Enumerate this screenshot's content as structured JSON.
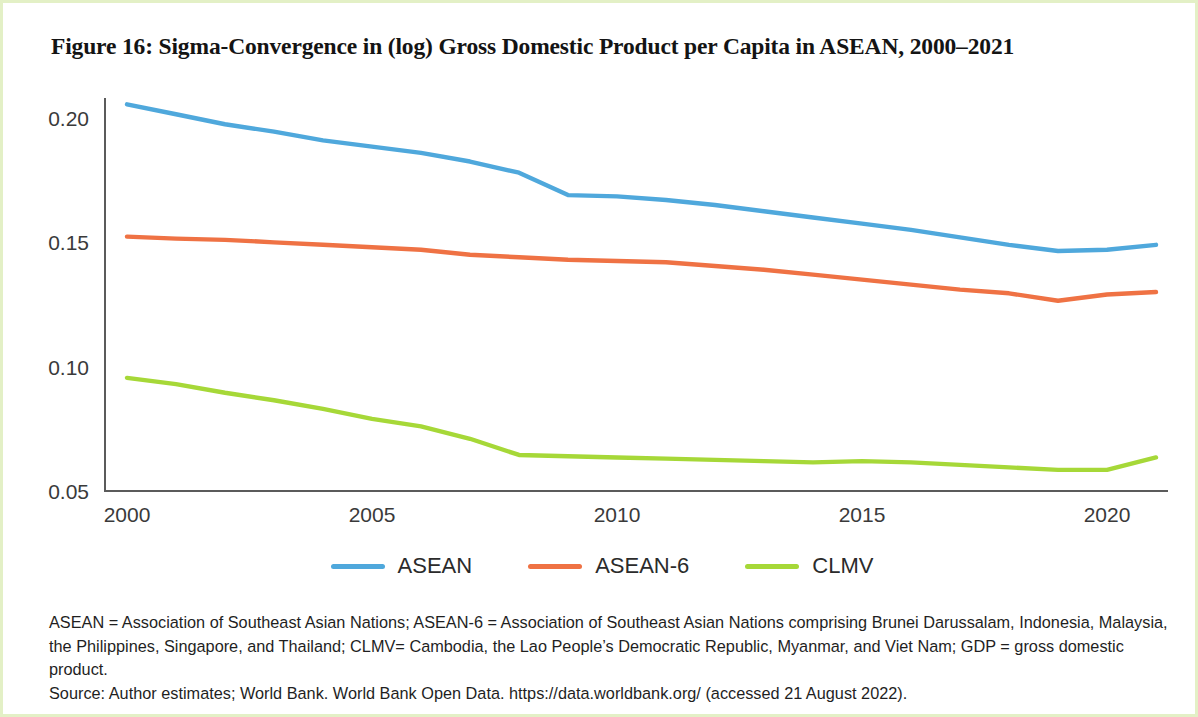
{
  "figure": {
    "title": "Figure 16: Sigma-Convergence in (log) Gross Domestic Product per Capita in ASEAN, 2000–2021",
    "border_color": "#e3f0c6"
  },
  "legend": {
    "position": "bottom-center",
    "items": [
      {
        "label": "ASEAN",
        "color": "#4fa8dc"
      },
      {
        "label": "ASEAN-6",
        "color": "#ef7244"
      },
      {
        "label": "CLMV",
        "color": "#a6d838"
      }
    ]
  },
  "notes": {
    "definitions": "ASEAN = Association of Southeast Asian Nations; ASEAN-6 = Association of Southeast Asian Nations comprising Brunei Darussalam, Indonesia, Malaysia, the Philippines, Singapore, and Thailand; CLMV= Cambodia, the Lao People’s Democratic Republic, Myanmar, and Viet Nam; GDP = gross domestic product.",
    "source": "Source: Author estimates; World Bank. World Bank Open Data. https://data.worldbank.org/ (accessed 21 August 2022)."
  },
  "chart_data": {
    "type": "line",
    "title": "Figure 16: Sigma-Convergence in (log) Gross Domestic Product per Capita in ASEAN, 2000–2021",
    "xlabel": "",
    "ylabel": "",
    "grid": false,
    "legend_position": "bottom-center",
    "xlim": [
      2000,
      2021
    ],
    "ylim": [
      0.05,
      0.215
    ],
    "x": [
      2000,
      2001,
      2002,
      2003,
      2004,
      2005,
      2006,
      2007,
      2008,
      2009,
      2010,
      2011,
      2012,
      2013,
      2014,
      2015,
      2016,
      2017,
      2018,
      2019,
      2020,
      2021
    ],
    "xticks": [
      2000,
      2005,
      2010,
      2015,
      2020
    ],
    "xtick_labels": [
      "2000",
      "2005",
      "2010",
      "2015",
      "2020"
    ],
    "yticks": [
      0.05,
      0.1,
      0.15,
      0.2
    ],
    "ytick_labels": [
      "0.05",
      "0.10",
      "0.15",
      "0.20"
    ],
    "series": [
      {
        "name": "ASEAN",
        "color": "#4fa8dc",
        "values": [
          0.2055,
          0.2015,
          0.1975,
          0.1945,
          0.191,
          0.1885,
          0.186,
          0.1825,
          0.178,
          0.169,
          0.1685,
          0.167,
          0.165,
          0.1625,
          0.16,
          0.1575,
          0.155,
          0.152,
          0.149,
          0.1465,
          0.147,
          0.149
        ]
      },
      {
        "name": "ASEAN-6",
        "color": "#ef7244",
        "values": [
          0.1523,
          0.1515,
          0.151,
          0.15,
          0.149,
          0.148,
          0.147,
          0.145,
          0.144,
          0.143,
          0.1425,
          0.142,
          0.1405,
          0.139,
          0.137,
          0.135,
          0.133,
          0.131,
          0.1295,
          0.1265,
          0.129,
          0.13
        ]
      },
      {
        "name": "CLMV",
        "color": "#a6d838",
        "values": [
          0.0955,
          0.093,
          0.0895,
          0.0865,
          0.083,
          0.079,
          0.076,
          0.071,
          0.0645,
          0.064,
          0.0635,
          0.063,
          0.0625,
          0.062,
          0.0615,
          0.062,
          0.0615,
          0.0605,
          0.0595,
          0.0585,
          0.0585,
          0.0635
        ]
      }
    ]
  }
}
